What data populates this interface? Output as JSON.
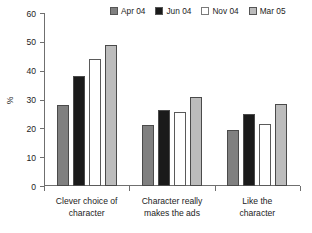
{
  "chart_data": {
    "type": "bar",
    "title": "",
    "xlabel": "",
    "ylabel": "%",
    "ylim": [
      0,
      60
    ],
    "yticks": [
      0,
      10,
      20,
      30,
      40,
      50,
      60
    ],
    "grid": false,
    "legend_position": "top-right",
    "categories": [
      "Clever choice of character",
      "Character really makes the ads",
      "Like the character"
    ],
    "series": [
      {
        "name": "Apr 04",
        "color": "#808080",
        "values": [
          28,
          21,
          19.5
        ]
      },
      {
        "name": "Jun 04",
        "color": "#1a1a1a",
        "values": [
          38,
          26.5,
          25
        ]
      },
      {
        "name": "Nov 04",
        "color": "#ffffff",
        "values": [
          44,
          25.5,
          21.5
        ]
      },
      {
        "name": "Mar 05",
        "color": "#bcbcbc",
        "values": [
          49,
          31,
          28.5
        ]
      }
    ]
  },
  "axis": {
    "y_title": "%",
    "y_tick_labels": [
      "0",
      "10",
      "20",
      "30",
      "40",
      "50",
      "60"
    ]
  },
  "legend": {
    "entries": [
      {
        "label": "Apr 04"
      },
      {
        "label": "Jun 04"
      },
      {
        "label": "Nov 04"
      },
      {
        "label": "Mar 05"
      }
    ]
  },
  "categories_lines": [
    [
      "Clever choice of",
      "character"
    ],
    [
      "Character really",
      "makes the ads"
    ],
    [
      "Like the",
      "character"
    ]
  ]
}
